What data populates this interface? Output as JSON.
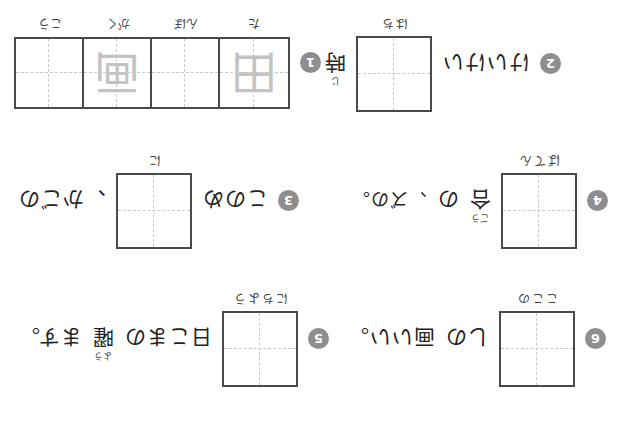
{
  "worksheet": {
    "title": "Kanji writing practice worksheet",
    "orientation": "upside-down",
    "page_background": "#ffffff",
    "box_border_color": "#4a4a4a",
    "guide_line_color": "#c9c9c9",
    "badge_color": "#8e8e8e",
    "ink_color": "#232323",
    "trace_color": "#c3c3c3"
  },
  "items": [
    {
      "number": "1",
      "badge_label": "1",
      "cells": [
        {
          "trace": "田",
          "reading": "た"
        },
        {
          "trace": "",
          "reading": "んぼ"
        },
        {
          "trace": "画",
          "reading": "がく"
        },
        {
          "trace": "",
          "reading": "こう"
        }
      ],
      "sentence": ""
    },
    {
      "number": "2",
      "badge_label": "2",
      "cells": [
        {
          "trace": "",
          "reading": ""
        }
      ],
      "box_reading": "はち",
      "left_text": "時",
      "left_ruby": "じ",
      "sentence": "けいけい"
    },
    {
      "number": "3",
      "badge_label": "3",
      "cells": [
        {
          "trace": "",
          "reading": ""
        }
      ],
      "box_reading": "に",
      "right_text": "このめ",
      "sentence": "、かごの"
    },
    {
      "number": "4",
      "badge_label": "4",
      "cells": [
        {
          "trace": "",
          "reading": ""
        }
      ],
      "box_reading": "ばてん",
      "left_text": "合",
      "left_ruby": "ごう",
      "sentence": "の",
      "tail_text": "、ズの。"
    },
    {
      "number": "5",
      "badge_label": "5",
      "cells": [
        {
          "trace": "",
          "reading": ""
        }
      ],
      "box_reading": "にちよう",
      "left_text": "曜",
      "left_ruby": "よう",
      "sentence": "日こまの",
      "tail_text": "ます。"
    },
    {
      "number": "6",
      "badge_label": "6",
      "cells": [
        {
          "trace": "",
          "reading": ""
        }
      ],
      "box_reading": "ここの",
      "sentence": "しの",
      "tail_text": "画いい。"
    }
  ]
}
